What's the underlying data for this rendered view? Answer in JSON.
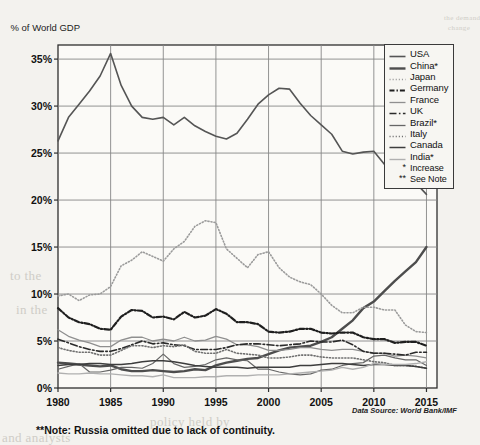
{
  "chart_data": {
    "type": "line",
    "title": "",
    "ylabel": "% of World GDP",
    "xlabel": "",
    "ylim": [
      0,
      36.5
    ],
    "xlim": [
      1980,
      2016
    ],
    "ytick_labels": [
      "0%",
      "5%",
      "10%",
      "15%",
      "20%",
      "25%",
      "30%",
      "35%"
    ],
    "yticks": [
      0,
      5,
      10,
      15,
      20,
      25,
      30,
      35
    ],
    "xtick_labels": [
      "1980",
      "1985",
      "1990",
      "1995",
      "2000",
      "2005",
      "2010",
      "2015"
    ],
    "xticks": [
      1980,
      1985,
      1990,
      1995,
      2000,
      2005,
      2010,
      2015
    ],
    "grid": true,
    "legend_position": "top-right",
    "source_note": "Data Source: World Bank/IMF",
    "footnote": "**Note: Russia omitted due to lack of continuity.",
    "legend_extra": [
      {
        "marker": "*",
        "label": "Increase"
      },
      {
        "marker": "**",
        "label": "See Note"
      }
    ],
    "x": [
      1980,
      1981,
      1982,
      1983,
      1984,
      1985,
      1986,
      1987,
      1988,
      1989,
      1990,
      1991,
      1992,
      1993,
      1994,
      1995,
      1996,
      1997,
      1998,
      1999,
      2000,
      2001,
      2002,
      2003,
      2004,
      2005,
      2006,
      2007,
      2008,
      2009,
      2010,
      2011,
      2012,
      2013,
      2014,
      2015
    ],
    "series": [
      {
        "name": "USA",
        "color": "#555555",
        "style": "solid",
        "width": 1.6,
        "values": [
          26.3,
          28.8,
          30.2,
          31.6,
          33.2,
          35.6,
          32.2,
          30.0,
          28.8,
          28.6,
          28.8,
          28.0,
          28.8,
          27.9,
          27.3,
          26.8,
          26.5,
          27.1,
          28.6,
          30.2,
          31.2,
          31.9,
          31.8,
          30.3,
          29.0,
          28.0,
          27.0,
          25.2,
          24.9,
          25.1,
          25.2,
          23.8,
          23.4,
          22.6,
          21.8,
          20.6
        ]
      },
      {
        "name": "China*",
        "color": "#4d4d4d",
        "style": "solid",
        "width": 2.4,
        "values": [
          2.7,
          2.6,
          2.5,
          2.4,
          2.3,
          2.4,
          2.0,
          1.8,
          1.8,
          1.9,
          1.8,
          1.7,
          1.8,
          2.0,
          1.9,
          2.4,
          2.7,
          2.9,
          3.1,
          3.2,
          3.6,
          4.0,
          4.3,
          4.4,
          4.5,
          4.9,
          5.4,
          6.3,
          7.2,
          8.5,
          9.2,
          10.3,
          11.4,
          12.4,
          13.4,
          15.0
        ]
      },
      {
        "name": "Japan",
        "color": "#9b9b9b",
        "style": "dotted",
        "width": 1.6,
        "values": [
          9.8,
          10.0,
          9.3,
          9.9,
          10.0,
          10.8,
          13.0,
          13.6,
          14.5,
          14.0,
          13.5,
          14.8,
          15.6,
          17.2,
          17.8,
          17.6,
          14.8,
          13.8,
          12.8,
          14.2,
          14.5,
          12.8,
          11.8,
          11.3,
          11.0,
          10.0,
          8.8,
          8.0,
          8.0,
          8.6,
          8.6,
          8.3,
          8.3,
          6.7,
          6.0,
          5.9
        ]
      },
      {
        "name": "Germany",
        "color": "#1f1f1f",
        "style": "dashdot",
        "width": 2.2,
        "values": [
          8.5,
          7.5,
          7.0,
          6.8,
          6.3,
          6.2,
          7.6,
          8.3,
          8.2,
          7.5,
          7.6,
          7.3,
          8.1,
          7.5,
          7.7,
          8.4,
          7.9,
          7.0,
          7.0,
          6.8,
          6.0,
          5.9,
          6.0,
          6.3,
          6.3,
          5.9,
          5.8,
          5.9,
          5.9,
          5.4,
          5.2,
          5.2,
          4.8,
          4.9,
          4.9,
          4.5
        ]
      },
      {
        "name": "France",
        "color": "#8f8f8f",
        "style": "solid",
        "width": 1.3,
        "values": [
          6.2,
          5.5,
          5.1,
          4.8,
          4.4,
          4.4,
          5.1,
          5.4,
          5.4,
          5.0,
          5.2,
          5.0,
          5.4,
          5.0,
          5.1,
          5.5,
          5.2,
          4.6,
          4.6,
          4.4,
          4.0,
          4.0,
          4.1,
          4.3,
          4.3,
          4.1,
          4.0,
          4.1,
          4.1,
          3.9,
          3.7,
          3.7,
          3.4,
          3.5,
          3.4,
          3.2
        ]
      },
      {
        "name": "UK",
        "color": "#2a2a2a",
        "style": "dashdot-long",
        "width": 1.6,
        "values": [
          5.2,
          4.8,
          4.4,
          4.1,
          3.9,
          3.9,
          4.2,
          4.6,
          5.0,
          4.7,
          4.8,
          4.6,
          4.5,
          4.1,
          4.1,
          4.1,
          4.3,
          4.6,
          4.7,
          4.7,
          4.6,
          4.5,
          4.6,
          4.7,
          5.0,
          4.9,
          4.9,
          5.1,
          4.6,
          3.9,
          3.7,
          3.7,
          3.6,
          3.5,
          3.8,
          3.8
        ]
      },
      {
        "name": "Brazil*",
        "color": "#666666",
        "style": "solid",
        "width": 1.2,
        "values": [
          2.0,
          2.3,
          2.6,
          1.7,
          1.7,
          1.9,
          2.2,
          2.2,
          2.1,
          2.6,
          3.6,
          2.6,
          2.2,
          2.3,
          2.5,
          3.0,
          3.2,
          3.0,
          2.9,
          2.0,
          2.0,
          1.7,
          1.5,
          1.4,
          1.5,
          1.9,
          2.0,
          2.4,
          2.6,
          2.7,
          3.4,
          3.5,
          3.2,
          3.0,
          3.0,
          2.4
        ]
      },
      {
        "name": "Italy",
        "color": "#6f6f6f",
        "style": "dotted",
        "width": 1.6,
        "values": [
          4.3,
          4.0,
          3.8,
          3.8,
          3.5,
          3.5,
          4.0,
          4.5,
          4.5,
          4.3,
          4.5,
          4.4,
          4.6,
          3.9,
          3.7,
          3.7,
          4.1,
          3.7,
          3.6,
          3.5,
          3.2,
          3.2,
          3.3,
          3.5,
          3.5,
          3.3,
          3.2,
          3.2,
          3.2,
          3.0,
          2.8,
          2.7,
          2.4,
          2.4,
          2.3,
          2.1
        ]
      },
      {
        "name": "Canada",
        "color": "#3d3d3d",
        "style": "solid",
        "width": 1.5,
        "values": [
          2.4,
          2.5,
          2.5,
          2.6,
          2.6,
          2.5,
          2.5,
          2.6,
          2.8,
          2.9,
          2.9,
          2.8,
          2.6,
          2.4,
          2.3,
          2.2,
          2.2,
          2.2,
          2.1,
          2.2,
          2.2,
          2.2,
          2.2,
          2.4,
          2.4,
          2.5,
          2.6,
          2.6,
          2.5,
          2.4,
          2.5,
          2.5,
          2.4,
          2.4,
          2.3,
          2.1
        ]
      },
      {
        "name": "India*",
        "color": "#b0b0b0",
        "style": "solid",
        "width": 1.4,
        "values": [
          1.6,
          1.5,
          1.5,
          1.6,
          1.5,
          1.5,
          1.4,
          1.3,
          1.3,
          1.2,
          1.4,
          1.1,
          1.1,
          1.1,
          1.2,
          1.2,
          1.3,
          1.3,
          1.3,
          1.4,
          1.4,
          1.4,
          1.5,
          1.6,
          1.7,
          1.8,
          1.9,
          2.2,
          2.0,
          2.2,
          2.6,
          2.5,
          2.5,
          2.5,
          2.6,
          2.8
        ]
      }
    ]
  },
  "bleed_text": {
    "l1": "the demand",
    "l2": "change",
    "l3": "of goods and services is the",
    "l4": "implemented",
    "l5": "to the",
    "l6": "in the",
    "l7": "policy held by",
    "l8": "and analysts"
  }
}
